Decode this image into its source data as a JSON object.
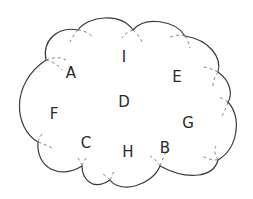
{
  "diagram": {
    "shape": "cloud",
    "colors": {
      "outline": "#3a3a3a",
      "dashed": "#777777",
      "text": "#2a2a2a",
      "background": "#ffffff"
    },
    "letters": [
      {
        "label": "I",
        "x": 124,
        "y": 57
      },
      {
        "label": "A",
        "x": 71,
        "y": 73
      },
      {
        "label": "E",
        "x": 177,
        "y": 77
      },
      {
        "label": "D",
        "x": 124,
        "y": 102
      },
      {
        "label": "F",
        "x": 54,
        "y": 114
      },
      {
        "label": "G",
        "x": 188,
        "y": 123
      },
      {
        "label": "C",
        "x": 86,
        "y": 143
      },
      {
        "label": "H",
        "x": 128,
        "y": 152
      },
      {
        "label": "B",
        "x": 165,
        "y": 148
      }
    ]
  }
}
